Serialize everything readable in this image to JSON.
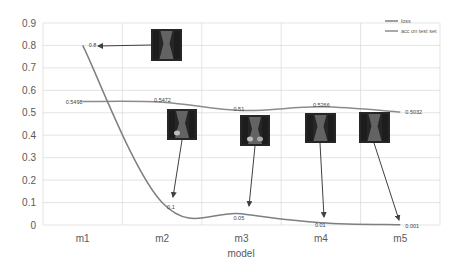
{
  "chart_data": {
    "type": "line",
    "title": "",
    "xlabel": "model",
    "ylabel": "",
    "categories": [
      "m1",
      "m2",
      "m3",
      "m4",
      "m5"
    ],
    "ylim": [
      0,
      0.9
    ],
    "yticks": [
      "0",
      "0.1",
      "0.2",
      "0.3",
      "0.4",
      "0.5",
      "0.6",
      "0.7",
      "0.8",
      "0.9"
    ],
    "grid": true,
    "legend_position": "top-right",
    "series": [
      {
        "name": "loss",
        "values": [
          0.8,
          0.1,
          0.05,
          0.01,
          0.001
        ],
        "labels": [
          "0.8",
          "0.1",
          "0.05",
          "0.01",
          "0.001"
        ],
        "color": "#7f7f7f"
      },
      {
        "name": "acc on test set",
        "values": [
          0.5498,
          0.5472,
          0.51,
          0.5266,
          0.5032
        ],
        "labels": [
          "0.5498",
          "0.5472",
          "0.51",
          "0.5266",
          "0.5032"
        ],
        "color": "#8c8c8c"
      }
    ],
    "annotations": [
      {
        "type": "image-thumbnail",
        "category": "m1",
        "points_to": "loss"
      },
      {
        "type": "image-thumbnail",
        "category": "m2",
        "points_to": "loss"
      },
      {
        "type": "image-thumbnail",
        "category": "m3",
        "points_to": "loss"
      },
      {
        "type": "image-thumbnail",
        "category": "m4",
        "points_to": "loss"
      },
      {
        "type": "image-thumbnail",
        "category": "m5",
        "points_to": "loss"
      }
    ]
  },
  "legend": {
    "items": [
      {
        "label": "loss"
      },
      {
        "label": "acc on test set"
      }
    ]
  },
  "colors": {
    "line": "#7f7f7f",
    "grid": "#d9d9d9",
    "text": "#595959",
    "arrow": "#404040"
  }
}
